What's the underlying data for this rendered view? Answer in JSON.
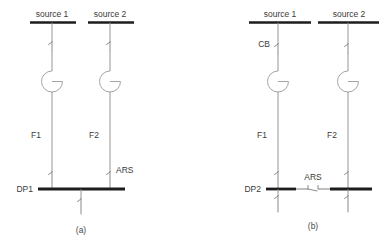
{
  "figure": {
    "type": "electrical-single-line-diagram",
    "panels": [
      {
        "id": "a",
        "caption": "(a)",
        "bus": {
          "label": "DP1",
          "style": "single-continuous-bus"
        },
        "branches": [
          {
            "source_label": "source 1",
            "feeder_label": "F1",
            "top_switch_label": "",
            "bus_switch_label": ""
          },
          {
            "source_label": "source 2",
            "feeder_label": "F2",
            "top_switch_label": "",
            "bus_switch_label": "ARS"
          }
        ],
        "outgoing": [
          {
            "label": ""
          }
        ]
      },
      {
        "id": "b",
        "caption": "(b)",
        "bus": {
          "label": "DP2",
          "style": "split-bus-with-tie",
          "tie_switch_label": "ARS"
        },
        "branches": [
          {
            "source_label": "source 1",
            "feeder_label": "F1",
            "top_switch_label": "CB",
            "bus_switch_label": ""
          },
          {
            "source_label": "source 2",
            "feeder_label": "F2",
            "top_switch_label": "",
            "bus_switch_label": ""
          }
        ],
        "outgoing": [
          {
            "label": ""
          },
          {
            "label": ""
          }
        ]
      }
    ]
  },
  "colors": {
    "background": "#ffffff",
    "bus_bar": "#1d1d1d",
    "conductor": "#8a8a8a",
    "text": "#3a3a3a"
  }
}
